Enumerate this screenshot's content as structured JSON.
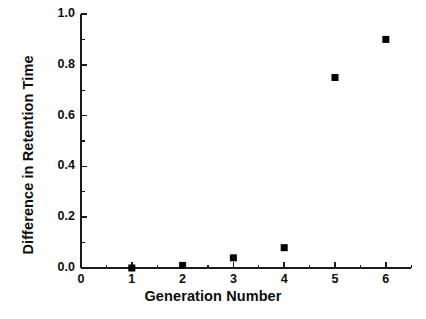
{
  "chart_data": {
    "type": "scatter",
    "title": "",
    "xlabel": "Generation Number",
    "ylabel": "Difference in Retention Time",
    "x": [
      1,
      2,
      3,
      4,
      5,
      6
    ],
    "values": [
      0.0,
      0.01,
      0.04,
      0.08,
      0.75,
      0.9
    ],
    "series": [
      {
        "name": "Difference in Retention Time",
        "x": [
          1,
          2,
          3,
          4,
          5,
          6
        ],
        "values": [
          0.0,
          0.01,
          0.04,
          0.08,
          0.75,
          0.9
        ]
      }
    ],
    "xlim": [
      0,
      6.5
    ],
    "ylim": [
      0.0,
      1.0
    ],
    "xticks": [
      0,
      1,
      2,
      3,
      4,
      5,
      6
    ],
    "yticks": [
      0.0,
      0.2,
      0.4,
      0.6,
      0.8,
      1.0
    ],
    "xtick_labels": [
      "0",
      "1",
      "2",
      "3",
      "4",
      "5",
      "6"
    ],
    "ytick_labels": [
      "0.0",
      "0.2",
      "0.4",
      "0.6",
      "0.8",
      "1.0"
    ],
    "xminor_ticks": [
      0.5,
      1.5,
      2.5,
      3.5,
      4.5,
      5.5,
      6.5
    ],
    "yminor_ticks": [
      0.1,
      0.3,
      0.5,
      0.7,
      0.9
    ],
    "grid": false,
    "legend": false,
    "marker": "square",
    "marker_color": "#000000",
    "marker_size_px": 7,
    "axis_color": "#1a1a1a",
    "background": "#ffffff"
  }
}
